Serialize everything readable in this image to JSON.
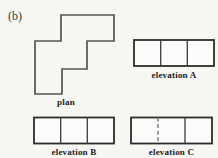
{
  "figure": {
    "part_label": "(b)",
    "plan": {
      "label": "plan",
      "shape": "staircase-polygon",
      "grid_units": "3x3, unit ~26.5px"
    },
    "elevations": [
      {
        "label": "elevation A",
        "cells": 3,
        "dividers": [
          "solid",
          "solid"
        ]
      },
      {
        "label": "elevation B",
        "cells": 3,
        "dividers": [
          "solid",
          "solid"
        ]
      },
      {
        "label": "elevation C",
        "cells": 3,
        "dividers": [
          "dashed",
          "solid"
        ]
      }
    ]
  },
  "colors": {
    "background": "#f6f6f3",
    "plan_outline": "#545454",
    "elevation_outline": "#2d2d2d",
    "divider": "#3a3a3a",
    "dashed_divider": "#6a6a6a",
    "text": "#1c1c1c"
  }
}
